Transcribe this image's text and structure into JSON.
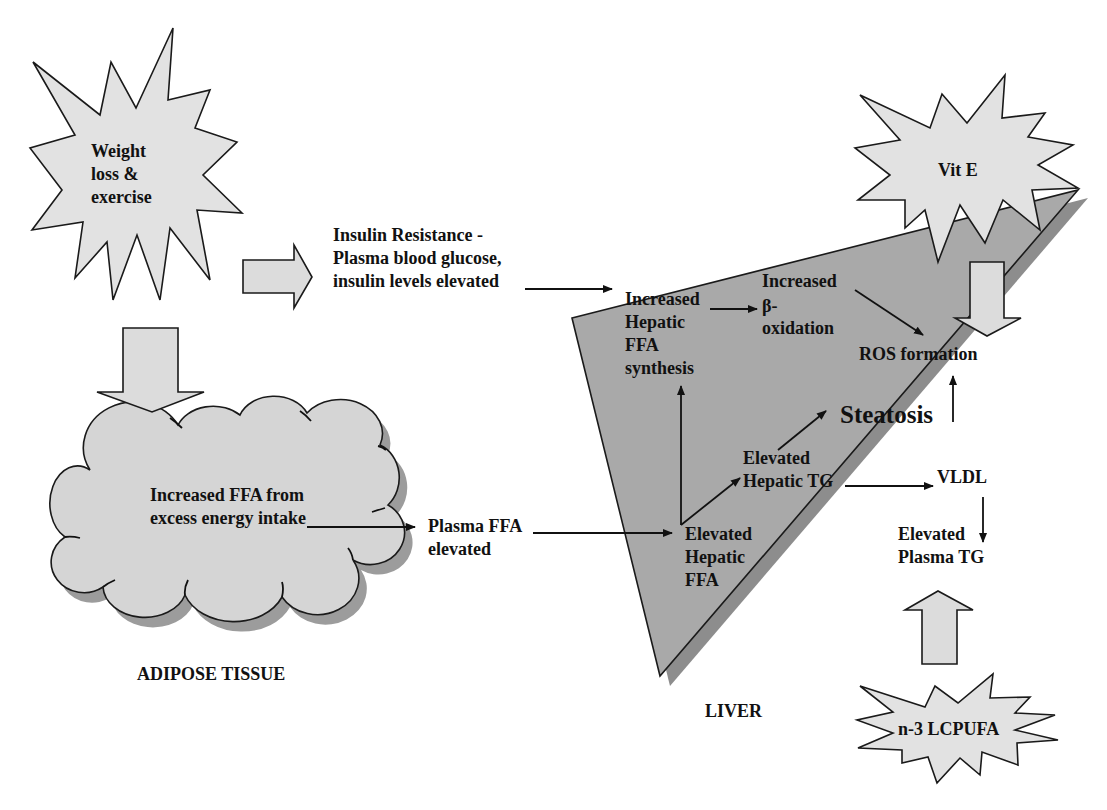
{
  "nodes": {
    "weight_loss": {
      "lines": [
        "Weight",
        "loss &",
        "exercise"
      ]
    },
    "insulin_resistance": {
      "lines": [
        "Insulin Resistance -",
        "Plasma blood glucose,",
        "insulin levels elevated"
      ]
    },
    "adipose_ffa": {
      "lines": [
        "Increased FFA from",
        "excess energy intake"
      ]
    },
    "plasma_ffa": {
      "lines": [
        "Plasma FFA",
        "elevated"
      ]
    },
    "hepatic_ffa_synthesis": {
      "lines": [
        "Increased",
        "Hepatic",
        "FFA",
        "synthesis"
      ]
    },
    "beta_oxidation": {
      "lines": [
        "Increased",
        "β-",
        "oxidation"
      ]
    },
    "ros_formation": {
      "label": "ROS formation"
    },
    "steatosis": {
      "label": "Steatosis"
    },
    "hepatic_tg": {
      "lines": [
        "Elevated",
        "Hepatic TG"
      ]
    },
    "vldl": {
      "label": "VLDL"
    },
    "plasma_tg": {
      "lines": [
        "Elevated",
        "Plasma TG"
      ]
    },
    "hepatic_ffa": {
      "lines": [
        "Elevated",
        "Hepatic",
        "FFA"
      ]
    },
    "vit_e": {
      "label": "Vit E"
    },
    "n3_lcpufa": {
      "label": "n-3 LCPUFA"
    }
  },
  "regions": {
    "adipose_tissue": "ADIPOSE TISSUE",
    "liver": "LIVER"
  },
  "edges": [
    {
      "from": "weight_loss",
      "to": "insulin_resistance",
      "style": "block-arrow"
    },
    {
      "from": "weight_loss",
      "to": "adipose_ffa",
      "style": "block-arrow"
    },
    {
      "from": "insulin_resistance",
      "to": "hepatic_ffa_synthesis",
      "style": "line-arrow"
    },
    {
      "from": "hepatic_ffa_synthesis",
      "to": "beta_oxidation",
      "style": "line-arrow"
    },
    {
      "from": "beta_oxidation",
      "to": "ros_formation",
      "style": "line-arrow"
    },
    {
      "from": "vit_e",
      "to": "ros_formation",
      "style": "block-arrow"
    },
    {
      "from": "steatosis",
      "to": "ros_formation",
      "style": "line-arrow"
    },
    {
      "from": "adipose_ffa",
      "to": "plasma_ffa",
      "style": "line-arrow"
    },
    {
      "from": "plasma_ffa",
      "to": "hepatic_ffa",
      "style": "line-arrow"
    },
    {
      "from": "hepatic_ffa",
      "to": "hepatic_ffa_synthesis",
      "style": "line-arrow"
    },
    {
      "from": "hepatic_ffa",
      "to": "hepatic_tg",
      "style": "line-arrow"
    },
    {
      "from": "hepatic_tg",
      "to": "steatosis",
      "style": "line-arrow"
    },
    {
      "from": "hepatic_tg",
      "to": "vldl",
      "style": "line-arrow"
    },
    {
      "from": "vldl",
      "to": "plasma_tg",
      "style": "line-arrow"
    },
    {
      "from": "n3_lcpufa",
      "to": "plasma_tg",
      "style": "block-arrow"
    }
  ],
  "colors": {
    "starburst_fill": "#e2e2e2",
    "block_arrow_fill": "#dcdcdc",
    "cloud_fill": "#d5d5d5",
    "cloud_shadow": "#9c9c9c",
    "liver_fill": "#a9a9a9",
    "liver_shadow": "#8d8d8d",
    "stroke": "#111111"
  }
}
